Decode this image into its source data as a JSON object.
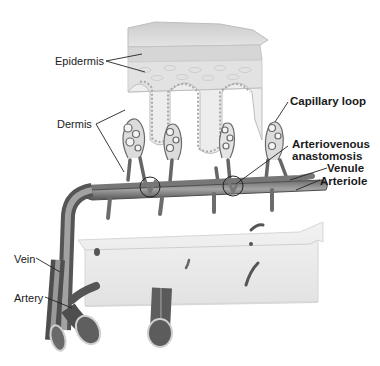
{
  "diagram": {
    "style": "grayscale anatomical illustration",
    "colors": {
      "background": "#ffffff",
      "epidermis_top": "#cfcfcf",
      "epidermis_cells": "#dedede",
      "dermis_block": "#ececec",
      "vessel_fill": "#8a8a8a",
      "vessel_dark": "#5a5a5a",
      "leader_line": "#222222",
      "label_text": "#1a1a1a"
    },
    "labels": {
      "epidermis": "Epidermis",
      "dermis": "Dermis",
      "capillary_loop": "Capillary loop",
      "arteriovenous_line1": "Arteriovenous",
      "arteriovenous_line2": "anastomosis",
      "venule": "Venule",
      "arteriole": "Arteriole",
      "vein": "Vein",
      "artery": "Artery"
    }
  }
}
